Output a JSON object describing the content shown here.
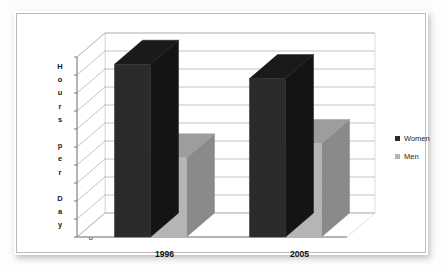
{
  "chart_data": {
    "type": "bar",
    "title": "",
    "subtitle": "",
    "xlabel": "",
    "ylabel": "Hours per Day",
    "ylabel_letters": [
      "H",
      "o",
      "u",
      "r",
      "s",
      "",
      "p",
      "e",
      "r",
      "",
      "D",
      "a",
      "y"
    ],
    "categories": [
      "1996",
      "2005"
    ],
    "series": [
      {
        "name": "Women",
        "values": [
          4.8,
          4.4
        ],
        "color": "#2b2b2b"
      },
      {
        "name": "Men",
        "values": [
          2.2,
          2.6
        ],
        "color": "#b5b5b5"
      }
    ],
    "ylim": [
      0,
      5
    ],
    "ytick_values": [
      0,
      0.5,
      1,
      1.5,
      2,
      2.5,
      3,
      3.5,
      4,
      4.5,
      5
    ],
    "ytick_labels": [
      "0",
      "0.5",
      "1",
      "1.5",
      "2",
      "2.5",
      "3",
      "3.5",
      "4",
      "4.5",
      "5"
    ],
    "grid": true,
    "grid_axis": "y",
    "legend_position": "right",
    "three_d": true,
    "style": {
      "plot_background": "#ffffff",
      "grid_color": "#9a9a9a",
      "axis_color": "#6e6e6e",
      "frame_border": "#b9b9b9",
      "page_background": "#fdfdfd",
      "text_color": "#1a1a1a",
      "women_front": "#2b2b2b",
      "women_top": "#1a1a1a",
      "women_side": "#141414",
      "men_front": "#b5b5b5",
      "men_top": "#9d9d9d",
      "men_side": "#8a8a8a"
    }
  },
  "legend": {
    "items": [
      {
        "label": "Women",
        "swatch": "#2b2b2b"
      },
      {
        "label": "Men",
        "swatch": "#b5b5b5"
      }
    ]
  },
  "axis": {
    "y_title": "Hours per Day",
    "y_ticks": [
      "5",
      "4.5",
      "4",
      "3.5",
      "3",
      "2.5",
      "2",
      "1.5",
      "1",
      "0.5",
      "0"
    ]
  },
  "categories": {
    "first": "1996",
    "second": "2005"
  }
}
